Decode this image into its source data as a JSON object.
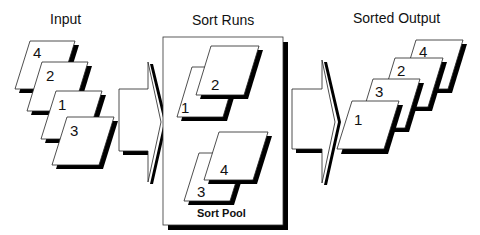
{
  "sections": {
    "input": {
      "title": "Input",
      "cards": [
        "4",
        "2",
        "1",
        "3"
      ]
    },
    "sort_runs": {
      "title": "Sort Runs",
      "pool_label": "Sort Pool",
      "runs": [
        {
          "back": "1",
          "front": "2"
        },
        {
          "back": "3",
          "front": "4"
        }
      ]
    },
    "output": {
      "title": "Sorted Output",
      "cards": [
        "4",
        "2",
        "3",
        "1"
      ]
    }
  },
  "colors": {
    "line": "#111111",
    "card_fill": "#ffffff",
    "shadow": "#000000"
  }
}
